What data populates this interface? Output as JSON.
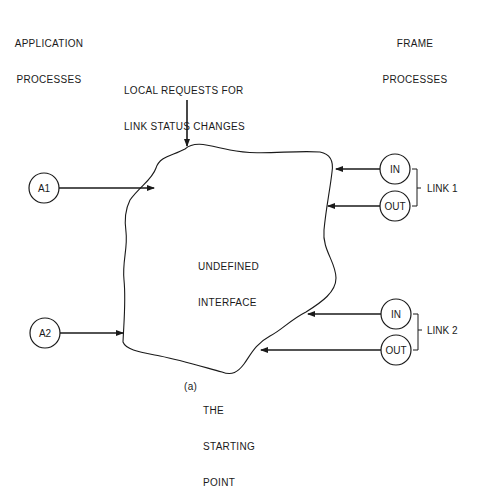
{
  "headings": {
    "application_processes": [
      "APPLICATION",
      "PROCESSES"
    ],
    "frame_processes": [
      "FRAME",
      "PROCESSES"
    ],
    "local_requests": [
      "LOCAL REQUESTS FOR",
      "LINK STATUS CHANGES"
    ]
  },
  "interface": {
    "label": [
      "UNDEFINED",
      "INTERFACE"
    ]
  },
  "application_nodes": [
    {
      "id": "A1",
      "label": "A1"
    },
    {
      "id": "A2",
      "label": "A2"
    }
  ],
  "links": [
    {
      "name": "LINK 1",
      "in_label": "IN",
      "out_label": "OUT"
    },
    {
      "name": "LINK 2",
      "in_label": "IN",
      "out_label": "OUT"
    }
  ],
  "caption": {
    "tag": "(a)",
    "lines": [
      "THE",
      "STARTING",
      "POINT"
    ]
  },
  "colors": {
    "ink": "#1a1a1a",
    "background": "#ffffff"
  }
}
